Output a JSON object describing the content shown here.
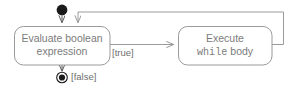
{
  "diagram": {
    "type": "uml-state-machine",
    "canvas": {
      "width": 296,
      "height": 87
    },
    "colors": {
      "background": "#ffffff",
      "border": "#9a9a9a",
      "text": "#7b7b7b",
      "guard_text": "#6f6f6f",
      "edge": "#9a9a9a",
      "node_fill": "#1a1a1a"
    },
    "states": {
      "initial": {
        "name": "initial-state",
        "kind": "initial-pseudostate"
      },
      "evaluate": {
        "name": "evaluate-boolean-expression",
        "line1": "Evaluate boolean",
        "line2": "expression"
      },
      "execute": {
        "name": "execute-while-body",
        "line1": "Execute",
        "keyword": "while",
        "line2_suffix": " body"
      },
      "final": {
        "name": "final-state",
        "kind": "final-state"
      }
    },
    "transitions": {
      "start": {
        "name": "start-transition",
        "guard": ""
      },
      "true_branch": {
        "name": "true-transition",
        "guard": "[true]"
      },
      "false_branch": {
        "name": "false-transition",
        "guard": "[false]"
      },
      "loop_back": {
        "name": "loop-back-transition",
        "guard": ""
      }
    }
  }
}
